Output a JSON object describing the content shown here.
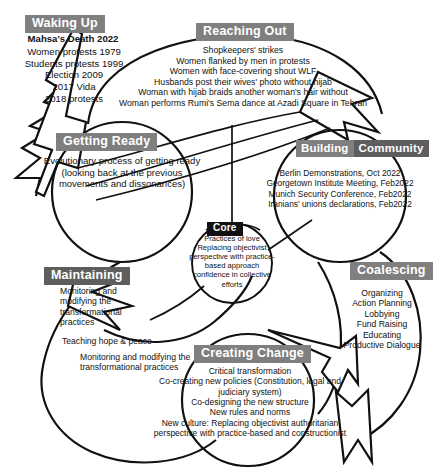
{
  "diagram": {
    "style": {
      "label_gray": "#7f7f7f",
      "label_dark_gray": "#5e5e5e",
      "label_black": "#111111",
      "stroke": "#111111",
      "background": "#ffffff"
    }
  },
  "sections": {
    "waking_up": {
      "label": "Waking Up",
      "headline": "Mahsa's Death 2022",
      "items_text": "Women protests 1979\nStudents protests 1999\nElection 2009\n2017 Vida\n2018 protests",
      "items": [
        "Women protests 1979",
        "Students protests 1999",
        "Election 2009",
        "2017 Vida",
        "2018 protests"
      ]
    },
    "reaching_out": {
      "label": "Reaching Out",
      "items_text": "Shopkeepers' strikes\nWomen flanked by men in protests\nWomen with face-covering shout WLF\nHusbands post their wives' photo without hijab\nWoman with hijab braids another woman's hair without\nWoman performs Rumi's Sema dance at Azadi Square in Tehran",
      "items": [
        "Shopkeepers' strikes",
        "Women flanked by men in protests",
        "Women with face-covering shout WLF",
        "Husbands post their wives' photo without hijab",
        "Woman with hijab braids another woman's hair without",
        "Woman performs Rumi's Sema dance at Azadi Square in Tehran"
      ]
    },
    "getting_ready": {
      "label": "Getting Ready",
      "body": "Evolutionary process of getting ready (looking back at the previous movements and dissonances)"
    },
    "building_community": {
      "label_part1": "Building",
      "label_part2": "Community",
      "items_text": "Berlin Demonstrations, Oct 2022\nGeorgetown Institute Meeting, Feb2022\nMunich Security Conference, Feb2022\nIranians' unions declarations, Feb2022",
      "items": [
        "Berlin Demonstrations, Oct 2022",
        "Georgetown Institute Meeting, Feb2022",
        "Munich Security Conference, Feb2022",
        "Iranians' unions declarations, Feb2022"
      ]
    },
    "core": {
      "label": "Core",
      "body": "Practices of love\nReplacing objectivist perspective with practice-based approach\nconfidence in collective efforts",
      "items": [
        "Practices of love",
        "Replacing objectivist perspective with practice-based approach",
        "confidence in collective efforts"
      ]
    },
    "maintaining": {
      "label": "Maintaining",
      "body": "Monitoring and modifying the transformational practices",
      "secondary_1": "Teaching hope & peace",
      "secondary_2": "Monitoring and modifying the transformational practices"
    },
    "coalescing": {
      "label": "Coalescing",
      "items_text": "Organizing\nAction Planning\nLobbying\nFund Raising\nEducating\nProductive Dialogue",
      "items": [
        "Organizing",
        "Action Planning",
        "Lobbying",
        "Fund Raising",
        "Educating",
        "Productive Dialogue"
      ]
    },
    "creating_change": {
      "label": "Creating Change",
      "items_text": "Critical transformation\nCo-creating new policies (Constitution, legal and judiciary system)\nCo-designing the new structure\nNew rules and norms\nNew culture: Replacing objectivist authoritarian perspective with practice-based and constructionist",
      "items": [
        "Critical transformation",
        "Co-creating new policies (Constitution, legal and judiciary system)",
        "Co-designing the new structure",
        "New rules and norms",
        "New culture: Replacing objectivist authoritarian perspective with practice-based and constructionist"
      ]
    }
  }
}
